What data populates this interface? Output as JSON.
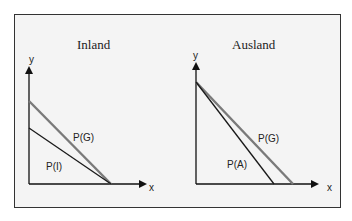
{
  "panels": [
    {
      "title": "Inland",
      "y_axis_label": "y",
      "x_axis_label": "x",
      "lines": [
        {
          "label": "P(G)",
          "color": "#7a7a7a"
        },
        {
          "label": "P(I)",
          "color": "#1a1a1a"
        }
      ]
    },
    {
      "title": "Ausland",
      "y_axis_label": "y",
      "x_axis_label": "x",
      "lines": [
        {
          "label": "P(G)",
          "color": "#7a7a7a"
        },
        {
          "label": "P(A)",
          "color": "#1a1a1a"
        }
      ]
    }
  ]
}
